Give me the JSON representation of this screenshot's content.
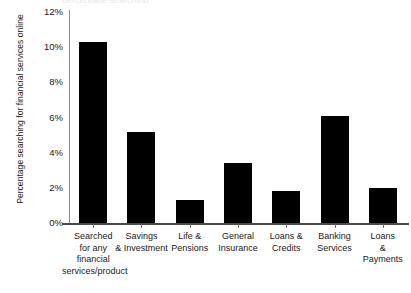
{
  "chart_data": {
    "type": "bar",
    "title": "",
    "title_remnant": "percentage searching",
    "xlabel": "",
    "ylabel": "Percentage searching for financial services online",
    "categories": [
      "Searched for any financial services/product",
      "Savings & Investment",
      "Life & Pensions",
      "General Insurance",
      "Loans & Credits",
      "Banking Services",
      "Loans & Payments"
    ],
    "category_lines": [
      [
        "Searched",
        "for any",
        "financial",
        "services/product"
      ],
      [
        "Savings",
        "& Investment"
      ],
      [
        "Life &",
        "Pensions"
      ],
      [
        "General",
        "Insurance"
      ],
      [
        "Loans &",
        "Credits"
      ],
      [
        "Banking",
        "Services"
      ],
      [
        "Loans",
        "&",
        "Payments"
      ]
    ],
    "values": [
      10.3,
      5.2,
      1.3,
      3.4,
      1.8,
      6.1,
      2.0
    ],
    "ylim": [
      0,
      12
    ],
    "ytick_values": [
      0,
      2,
      4,
      6,
      8,
      10,
      12
    ],
    "ytick_labels": [
      "0%",
      "2%",
      "4%",
      "6%",
      "8%",
      "10%",
      "12%"
    ],
    "grid": false,
    "legend": null,
    "bar_color": "#000000",
    "axis_color": "#8d8d8d",
    "background_color": "#ffffff"
  }
}
